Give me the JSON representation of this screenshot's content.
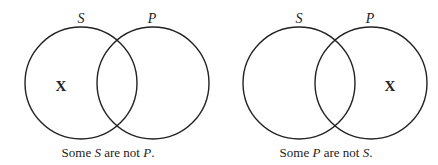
{
  "diagrams": [
    {
      "labels": {
        "left": "S",
        "right": "P"
      },
      "mark": "X",
      "mark_region": "S only",
      "caption": {
        "pre": "Some ",
        "term1": "S",
        "mid": " are not ",
        "term2": "P",
        "post": "."
      }
    },
    {
      "labels": {
        "left": "S",
        "right": "P"
      },
      "mark": "X",
      "mark_region": "P only",
      "caption": {
        "pre": "Some ",
        "term1": "P",
        "mid": " are not ",
        "term2": "S",
        "post": "."
      }
    }
  ],
  "colors": {
    "stroke": "#222222",
    "background": "#ffffff"
  }
}
